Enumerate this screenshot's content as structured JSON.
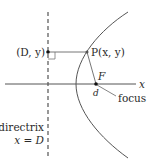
{
  "diagram": {
    "labels": {
      "directrix_point": "(D, y)",
      "curve_point": "P(x, y)",
      "focus_letter": "F",
      "focus_coord": "d",
      "axis": "x",
      "focus_text": "focus",
      "directrix_text": "directrix",
      "directrix_eq": "x = D"
    },
    "colors": {
      "line": "#555555",
      "dot": "#111111",
      "text": "#2a2a2a"
    }
  }
}
